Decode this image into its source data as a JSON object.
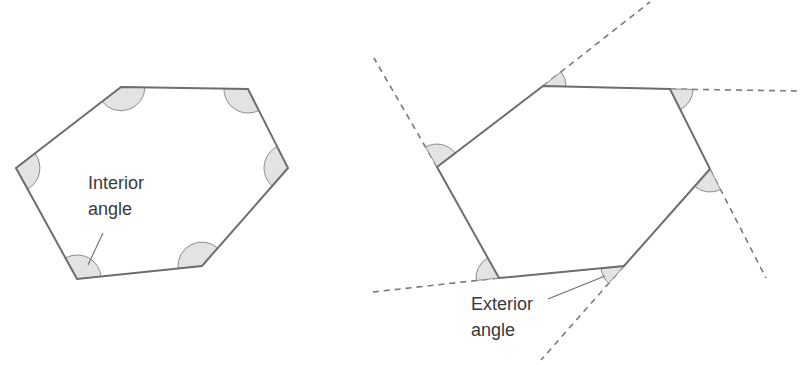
{
  "diagram": {
    "left": {
      "label_line1": "Interior",
      "label_line2": "angle",
      "vertices": [
        [
          121,
          87
        ],
        [
          248,
          89
        ],
        [
          288,
          168
        ],
        [
          202,
          266
        ],
        [
          77,
          279
        ],
        [
          16,
          168
        ]
      ]
    },
    "right": {
      "label_line1": "Exterior",
      "label_line2": "angle",
      "vertices": [
        [
          543,
          86
        ],
        [
          670,
          89
        ],
        [
          710,
          169
        ],
        [
          624,
          266
        ],
        [
          499,
          278
        ],
        [
          437,
          167
        ]
      ],
      "extensions": [
        [
          543,
          86,
          650,
          2
        ],
        [
          670,
          89,
          800,
          91
        ],
        [
          710,
          169,
          766,
          278
        ],
        [
          624,
          266,
          541,
          360
        ],
        [
          499,
          278,
          373,
          292
        ],
        [
          437,
          167,
          374,
          58
        ]
      ]
    },
    "colors": {
      "edge": "#6e6e6e",
      "angle_fill": "#e3e3e3",
      "text": "#3a3a3a"
    }
  }
}
